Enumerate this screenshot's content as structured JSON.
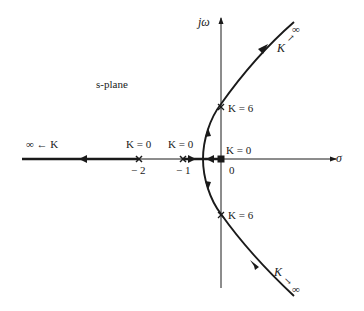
{
  "diagram": {
    "type": "root-locus",
    "plane_label": "s-plane",
    "axes": {
      "real_axis_label": "σ",
      "imag_axis_label": "jω"
    },
    "poles": [
      {
        "position": "-2",
        "gain_label": "K = 0"
      },
      {
        "position": "-1",
        "gain_label": "K = 0"
      },
      {
        "position": "0",
        "gain_label": "K = 0"
      }
    ],
    "origin_label": "0",
    "crossings": [
      {
        "location": "upper jω-axis",
        "gain_label": "K = 6"
      },
      {
        "location": "lower jω-axis",
        "gain_label": "K = 6"
      }
    ],
    "asymptote_labels": {
      "left": "∞ ← K",
      "upper_right_K": "K",
      "upper_right_arrow": "↗",
      "upper_right_inf": "∞",
      "lower_right_K": "K",
      "lower_right_arrow": "↘",
      "lower_right_inf": "∞"
    },
    "tick_labels": {
      "minus_two": "− 2",
      "minus_one": "− 1"
    }
  }
}
